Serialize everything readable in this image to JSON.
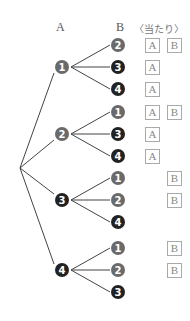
{
  "headers": {
    "a": "A",
    "b": "B",
    "result": "〈当たり〉"
  },
  "colors": {
    "light": "#6a6a6a",
    "dark": "#222222",
    "line": "#444444"
  },
  "tree": [
    {
      "a": 1,
      "y": 67,
      "branches": [
        {
          "b": 2,
          "y": 45,
          "win": [
            "A",
            "B"
          ]
        },
        {
          "b": 3,
          "y": 67,
          "win": [
            "A"
          ]
        },
        {
          "b": 4,
          "y": 89,
          "win": [
            "A"
          ]
        }
      ]
    },
    {
      "a": 2,
      "y": 134,
      "branches": [
        {
          "b": 1,
          "y": 112,
          "win": [
            "A",
            "B"
          ]
        },
        {
          "b": 3,
          "y": 134,
          "win": [
            "A"
          ]
        },
        {
          "b": 4,
          "y": 156,
          "win": [
            "A"
          ]
        }
      ]
    },
    {
      "a": 3,
      "y": 200,
      "branches": [
        {
          "b": 1,
          "y": 178,
          "win": [
            "B"
          ]
        },
        {
          "b": 2,
          "y": 200,
          "win": [
            "B"
          ]
        },
        {
          "b": 4,
          "y": 222,
          "win": []
        }
      ]
    },
    {
      "a": 4,
      "y": 270,
      "branches": [
        {
          "b": 1,
          "y": 248,
          "win": [
            "B"
          ]
        },
        {
          "b": 2,
          "y": 270,
          "win": [
            "B"
          ]
        },
        {
          "b": 3,
          "y": 292,
          "win": []
        }
      ]
    }
  ]
}
